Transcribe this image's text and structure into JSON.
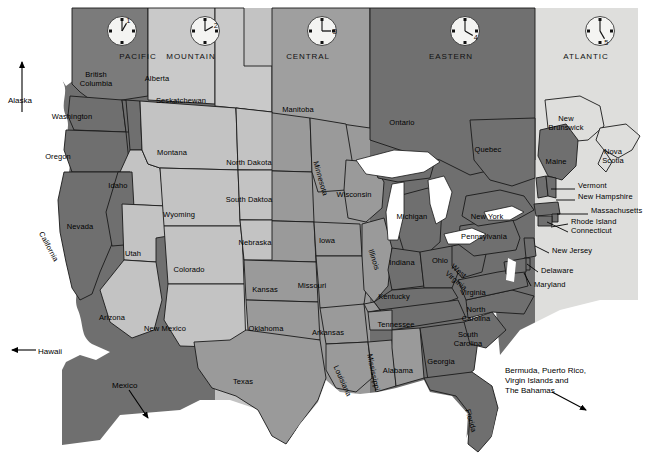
{
  "map": {
    "title": "United States Time Zone Map",
    "background": "#ffffff",
    "border_color": "#000000"
  },
  "palette": {
    "pacific": "#6f6f6f",
    "mountain": "#c3c3c3",
    "central": "#9a9a9a",
    "eastern": "#6f6f6f",
    "atlantic": "#dededc",
    "canada_bc": "#7b7b7b",
    "canada_light": "#c9c9c9",
    "canada_mid": "#9f9f9f",
    "canada_dark": "#707070",
    "lake": "#ffffff",
    "outline": "#1a1a1a",
    "text": "#000000"
  },
  "timezones": [
    {
      "id": "pacific",
      "name": "PACIFIC",
      "clock_hour": "1",
      "x0": 62,
      "x1": 215,
      "name_x": 138,
      "clock_x": 105,
      "fill": "#6f6f6f"
    },
    {
      "id": "mountain",
      "name": "MOUNTAIN",
      "clock_hour": "2",
      "x0": 215,
      "x1": 272,
      "name_x": 191,
      "clock_x": 188,
      "fill": "#c3c3c3"
    },
    {
      "id": "central",
      "name": "CENTRAL",
      "clock_hour": "3",
      "x0": 272,
      "x1": 370,
      "name_x": 308,
      "clock_x": 305,
      "fill": "#9a9a9a"
    },
    {
      "id": "eastern",
      "name": "EASTERN",
      "clock_hour": "4",
      "x0": 370,
      "x1": 535,
      "name_x": 451,
      "clock_x": 448,
      "fill": "#6f6f6f"
    },
    {
      "id": "atlantic",
      "name": "ATLANTIC",
      "clock_hour": "5",
      "x0": 535,
      "x1": 638,
      "name_x": 586,
      "clock_x": 583,
      "fill": "#dededc"
    }
  ],
  "states": [
    {
      "name": "Washington",
      "x": 72,
      "y": 112,
      "rot": 0,
      "w": 58
    },
    {
      "name": "Oregon",
      "x": 58,
      "y": 152,
      "rot": 0,
      "w": 46
    },
    {
      "name": "California",
      "x": 45,
      "y": 230,
      "rot": 62,
      "w": 52
    },
    {
      "name": "Nevada",
      "x": 80,
      "y": 222,
      "rot": 0,
      "w": 40
    },
    {
      "name": "Idaho",
      "x": 118,
      "y": 181,
      "rot": 0,
      "w": 30
    },
    {
      "name": "Utah",
      "x": 133,
      "y": 249,
      "rot": 0,
      "w": 26
    },
    {
      "name": "Arizona",
      "x": 112,
      "y": 313,
      "rot": 0,
      "w": 40
    },
    {
      "name": "Montana",
      "x": 172,
      "y": 148,
      "rot": 0,
      "w": 44
    },
    {
      "name": "Wyoming",
      "x": 179,
      "y": 210,
      "rot": 0,
      "w": 46
    },
    {
      "name": "Colorado",
      "x": 189,
      "y": 265,
      "rot": 0,
      "w": 44
    },
    {
      "name": "New Mexico",
      "x": 165,
      "y": 324,
      "rot": 0,
      "w": 56
    },
    {
      "name": "North Dakota",
      "x": 249,
      "y": 158,
      "rot": 0,
      "w": 56
    },
    {
      "name": "South Daktoa",
      "x": 249,
      "y": 195,
      "rot": 0,
      "w": 56
    },
    {
      "name": "Nebraska",
      "x": 255,
      "y": 238,
      "rot": 0,
      "w": 48
    },
    {
      "name": "Kansas",
      "x": 265,
      "y": 285,
      "rot": 0,
      "w": 38
    },
    {
      "name": "Oklahoma",
      "x": 266,
      "y": 324,
      "rot": 0,
      "w": 46
    },
    {
      "name": "Texas",
      "x": 243,
      "y": 377,
      "rot": 0,
      "w": 32
    },
    {
      "name": "Minnesota",
      "x": 320,
      "y": 160,
      "rot": 74,
      "w": 50
    },
    {
      "name": "Iowa",
      "x": 327,
      "y": 236,
      "rot": 0,
      "w": 26
    },
    {
      "name": "Missouri",
      "x": 312,
      "y": 281,
      "rot": 0,
      "w": 42
    },
    {
      "name": "Arkansas",
      "x": 328,
      "y": 328,
      "rot": 0,
      "w": 44
    },
    {
      "name": "Louisiana",
      "x": 340,
      "y": 364,
      "rot": 66,
      "w": 44
    },
    {
      "name": "Mississippi",
      "x": 374,
      "y": 353,
      "rot": 78,
      "w": 48
    },
    {
      "name": "Wisconsin",
      "x": 354,
      "y": 190,
      "rot": 0,
      "w": 46
    },
    {
      "name": "Illinois",
      "x": 375,
      "y": 248,
      "rot": 72,
      "w": 38
    },
    {
      "name": "Michigan",
      "x": 412,
      "y": 212,
      "rot": 0,
      "w": 44
    },
    {
      "name": "Indiana",
      "x": 402,
      "y": 258,
      "rot": 0,
      "w": 38
    },
    {
      "name": "Ohio",
      "x": 440,
      "y": 256,
      "rot": 0,
      "w": 26
    },
    {
      "name": "Kentucky",
      "x": 394,
      "y": 292,
      "rot": 0,
      "w": 44
    },
    {
      "name": "Tennessee",
      "x": 396,
      "y": 320,
      "rot": 0,
      "w": 50
    },
    {
      "name": "Alabama",
      "x": 398,
      "y": 366,
      "rot": 0,
      "w": 42
    },
    {
      "name": "Georgia",
      "x": 441,
      "y": 357,
      "rot": 0,
      "w": 38
    },
    {
      "name": "Florida",
      "x": 472,
      "y": 408,
      "rot": 74,
      "w": 38
    },
    {
      "name": "South\nCarolina",
      "x": 468,
      "y": 330,
      "rot": 0,
      "w": 40
    },
    {
      "name": "North\nCarolina",
      "x": 476,
      "y": 305,
      "rot": 0,
      "w": 40
    },
    {
      "name": "Virginia",
      "x": 473,
      "y": 288,
      "rot": 0,
      "w": 38
    },
    {
      "name": "West\nVirginia",
      "x": 455,
      "y": 262,
      "rot": 40,
      "w": 34
    },
    {
      "name": "Pennsylvania",
      "x": 484,
      "y": 232,
      "rot": 0,
      "w": 54
    },
    {
      "name": "New York",
      "x": 487,
      "y": 212,
      "rot": 0,
      "w": 44
    },
    {
      "name": "Maine",
      "x": 556,
      "y": 157,
      "rot": 0,
      "w": 30
    }
  ],
  "canada": [
    {
      "name": "British\nColumbia",
      "x": 96,
      "y": 70,
      "w": 46
    },
    {
      "name": "Alberta",
      "x": 157,
      "y": 74,
      "w": 40
    },
    {
      "name": "Seskatchewan",
      "x": 181,
      "y": 96,
      "w": 62
    },
    {
      "name": "Manitoba",
      "x": 298,
      "y": 105,
      "w": 46
    },
    {
      "name": "Ontario",
      "x": 402,
      "y": 118,
      "w": 40
    },
    {
      "name": "Quebec",
      "x": 488,
      "y": 145,
      "w": 40
    },
    {
      "name": "New\nBrunswick",
      "x": 566,
      "y": 114,
      "w": 48
    },
    {
      "name": "Nova\nScotia",
      "x": 613,
      "y": 147,
      "w": 34
    }
  ],
  "callouts": [
    {
      "name": "Vermont",
      "x": 578,
      "y": 186,
      "lx1": 551,
      "ly1": 189,
      "lx2": 575,
      "ly2": 189
    },
    {
      "name": "New Hampshire",
      "x": 578,
      "y": 197,
      "lx1": 556,
      "ly1": 200,
      "lx2": 575,
      "ly2": 200
    },
    {
      "name": "Massachusetts",
      "x": 591,
      "y": 211,
      "lx1": 557,
      "ly1": 214,
      "lx2": 588,
      "ly2": 214
    },
    {
      "name": "Rhode Island",
      "x": 571,
      "y": 222,
      "lx1": 551,
      "ly1": 227,
      "lx2": 568,
      "ly2": 224
    },
    {
      "name": "Connecticut",
      "x": 571,
      "y": 231,
      "lx1": 547,
      "ly1": 222,
      "lx2": 568,
      "ly2": 232
    },
    {
      "name": "New Jersey",
      "x": 552,
      "y": 251,
      "lx1": 535,
      "ly1": 246,
      "lx2": 549,
      "ly2": 253
    },
    {
      "name": "Delaware",
      "x": 541,
      "y": 271,
      "lx1": 527,
      "ly1": 264,
      "lx2": 538,
      "ly2": 272
    },
    {
      "name": "Maryland",
      "x": 534,
      "y": 285,
      "lx1": 524,
      "ly1": 273,
      "lx2": 531,
      "ly2": 286
    }
  ],
  "arrows": [
    {
      "name": "Alaska",
      "label": "Alaska",
      "label_x": 8,
      "label_y": 96,
      "x1": 22,
      "y1": 112,
      "x2": 22,
      "y2": 62,
      "dir": "up"
    },
    {
      "name": "Hawaii",
      "label": "Hawaii",
      "label_x": 38,
      "label_y": 347,
      "x1": 36,
      "y1": 350,
      "x2": 12,
      "y2": 350,
      "dir": "left"
    },
    {
      "name": "Mexico",
      "label": "Mexico",
      "label_x": 112,
      "label_y": 381,
      "x1": 129,
      "y1": 390,
      "x2": 148,
      "y2": 418,
      "dir": "downright"
    },
    {
      "name": "Islands",
      "label": "Bermuda, Puerto Rico,\nVirgin Islands and\nThe Bahamas",
      "label_x": 505,
      "label_y": 366,
      "x1": 552,
      "y1": 392,
      "x2": 586,
      "y2": 410,
      "dir": "downright"
    }
  ]
}
